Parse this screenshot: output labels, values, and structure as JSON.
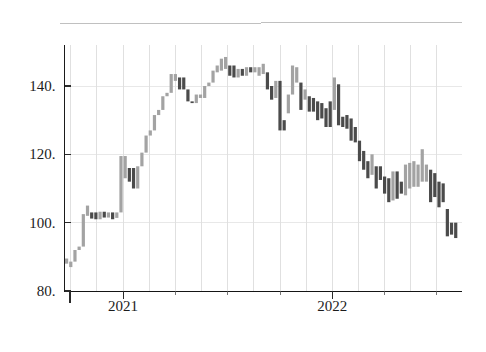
{
  "chart_data": {
    "type": "bar",
    "subtype": "candlestick-ohlc-weekly",
    "title": "",
    "subtitle": "",
    "xlabel": "",
    "ylabel": "",
    "ylim": [
      80,
      152
    ],
    "xlim": [
      2020.72,
      2022.62
    ],
    "grid": {
      "vertical": true,
      "horizontal": true,
      "style": "light-gray-quarterly"
    },
    "legend": {
      "visible": false,
      "entries": []
    },
    "y_ticks": [
      80,
      100,
      120,
      140
    ],
    "y_tick_labels": [
      "80.",
      "100.",
      "120.",
      "140."
    ],
    "x_ticks": [
      2021,
      2022
    ],
    "x_tick_labels": [
      "2021",
      "2022"
    ],
    "x_minor_ticks": [
      2020.75,
      2021.25,
      2021.5,
      2021.75,
      2022.25,
      2022.5
    ],
    "colors": {
      "up": "#a3a3a3",
      "down": "#4b4b4b",
      "axis": "#1a1a1a",
      "grid": "#d8d8d8",
      "background": "#ffffff",
      "text": "#1c1c1c"
    },
    "series_name": "price",
    "bar_width_px": 3.2,
    "note": "Each bar is one week: body spans open-close, direction light=rising, dark=falling",
    "bars": [
      {
        "x": 2020.73,
        "open": 88.0,
        "close": 89.5,
        "dir": "up"
      },
      {
        "x": 2020.75,
        "open": 87.0,
        "close": 88.6,
        "dir": "up"
      },
      {
        "x": 2020.77,
        "open": 88.6,
        "close": 92.0,
        "dir": "up"
      },
      {
        "x": 2020.79,
        "open": 92.0,
        "close": 93.0,
        "dir": "up"
      },
      {
        "x": 2020.81,
        "open": 93.0,
        "close": 102.5,
        "dir": "up"
      },
      {
        "x": 2020.83,
        "open": 102.0,
        "close": 105.0,
        "dir": "up"
      },
      {
        "x": 2020.85,
        "open": 101.2,
        "close": 103.0,
        "dir": "down"
      },
      {
        "x": 2020.87,
        "open": 103.0,
        "close": 101.0,
        "dir": "down"
      },
      {
        "x": 2020.89,
        "open": 101.0,
        "close": 103.2,
        "dir": "up"
      },
      {
        "x": 2020.91,
        "open": 103.2,
        "close": 101.5,
        "dir": "down"
      },
      {
        "x": 2020.93,
        "open": 101.5,
        "close": 103.0,
        "dir": "up"
      },
      {
        "x": 2020.95,
        "open": 103.0,
        "close": 101.0,
        "dir": "down"
      },
      {
        "x": 2020.97,
        "open": 101.4,
        "close": 103.0,
        "dir": "up"
      },
      {
        "x": 2020.99,
        "open": 103.0,
        "close": 119.5,
        "dir": "up"
      },
      {
        "x": 2021.01,
        "open": 113.0,
        "close": 119.5,
        "dir": "up"
      },
      {
        "x": 2021.03,
        "open": 112.0,
        "close": 116.0,
        "dir": "down"
      },
      {
        "x": 2021.05,
        "open": 116.0,
        "close": 110.0,
        "dir": "down"
      },
      {
        "x": 2021.07,
        "open": 110.0,
        "close": 116.5,
        "dir": "up"
      },
      {
        "x": 2021.09,
        "open": 116.5,
        "close": 120.5,
        "dir": "up"
      },
      {
        "x": 2021.11,
        "open": 120.5,
        "close": 125.5,
        "dir": "up"
      },
      {
        "x": 2021.13,
        "open": 125.5,
        "close": 127.0,
        "dir": "up"
      },
      {
        "x": 2021.15,
        "open": 127.0,
        "close": 131.5,
        "dir": "up"
      },
      {
        "x": 2021.17,
        "open": 131.5,
        "close": 133.0,
        "dir": "up"
      },
      {
        "x": 2021.19,
        "open": 133.0,
        "close": 137.0,
        "dir": "up"
      },
      {
        "x": 2021.21,
        "open": 137.0,
        "close": 138.0,
        "dir": "up"
      },
      {
        "x": 2021.23,
        "open": 138.0,
        "close": 143.5,
        "dir": "up"
      },
      {
        "x": 2021.25,
        "open": 141.5,
        "close": 143.5,
        "dir": "up"
      },
      {
        "x": 2021.27,
        "open": 139.0,
        "close": 142.5,
        "dir": "down"
      },
      {
        "x": 2021.29,
        "open": 142.5,
        "close": 139.0,
        "dir": "down"
      },
      {
        "x": 2021.31,
        "open": 139.0,
        "close": 135.5,
        "dir": "down"
      },
      {
        "x": 2021.33,
        "open": 135.5,
        "close": 135.0,
        "dir": "down"
      },
      {
        "x": 2021.35,
        "open": 135.0,
        "close": 137.5,
        "dir": "up"
      },
      {
        "x": 2021.37,
        "open": 137.5,
        "close": 136.5,
        "dir": "up"
      },
      {
        "x": 2021.39,
        "open": 136.5,
        "close": 140.0,
        "dir": "up"
      },
      {
        "x": 2021.41,
        "open": 140.0,
        "close": 141.0,
        "dir": "up"
      },
      {
        "x": 2021.43,
        "open": 141.0,
        "close": 144.5,
        "dir": "up"
      },
      {
        "x": 2021.45,
        "open": 144.0,
        "close": 146.0,
        "dir": "up"
      },
      {
        "x": 2021.47,
        "open": 144.5,
        "close": 148.0,
        "dir": "up"
      },
      {
        "x": 2021.49,
        "open": 145.0,
        "close": 148.5,
        "dir": "up"
      },
      {
        "x": 2021.51,
        "open": 143.0,
        "close": 146.0,
        "dir": "down"
      },
      {
        "x": 2021.53,
        "open": 146.0,
        "close": 142.5,
        "dir": "down"
      },
      {
        "x": 2021.55,
        "open": 142.5,
        "close": 145.0,
        "dir": "up"
      },
      {
        "x": 2021.57,
        "open": 145.0,
        "close": 143.0,
        "dir": "down"
      },
      {
        "x": 2021.59,
        "open": 143.0,
        "close": 145.5,
        "dir": "up"
      },
      {
        "x": 2021.61,
        "open": 145.5,
        "close": 144.0,
        "dir": "down"
      },
      {
        "x": 2021.63,
        "open": 144.0,
        "close": 145.5,
        "dir": "up"
      },
      {
        "x": 2021.65,
        "open": 143.0,
        "close": 145.5,
        "dir": "up"
      },
      {
        "x": 2021.67,
        "open": 143.5,
        "close": 146.5,
        "dir": "up"
      },
      {
        "x": 2021.69,
        "open": 144.0,
        "close": 139.0,
        "dir": "down"
      },
      {
        "x": 2021.71,
        "open": 140.0,
        "close": 136.0,
        "dir": "down"
      },
      {
        "x": 2021.73,
        "open": 136.5,
        "close": 141.5,
        "dir": "up"
      },
      {
        "x": 2021.75,
        "open": 141.5,
        "close": 127.0,
        "dir": "down"
      },
      {
        "x": 2021.77,
        "open": 130.0,
        "close": 127.0,
        "dir": "down"
      },
      {
        "x": 2021.79,
        "open": 132.0,
        "close": 137.5,
        "dir": "up"
      },
      {
        "x": 2021.81,
        "open": 137.5,
        "close": 146.0,
        "dir": "up"
      },
      {
        "x": 2021.83,
        "open": 141.0,
        "close": 145.5,
        "dir": "up"
      },
      {
        "x": 2021.85,
        "open": 133.0,
        "close": 141.0,
        "dir": "down"
      },
      {
        "x": 2021.87,
        "open": 136.0,
        "close": 139.0,
        "dir": "up"
      },
      {
        "x": 2021.89,
        "open": 132.5,
        "close": 137.0,
        "dir": "down"
      },
      {
        "x": 2021.91,
        "open": 132.5,
        "close": 136.5,
        "dir": "down"
      },
      {
        "x": 2021.93,
        "open": 130.0,
        "close": 135.5,
        "dir": "down"
      },
      {
        "x": 2021.95,
        "open": 130.5,
        "close": 135.0,
        "dir": "down"
      },
      {
        "x": 2021.97,
        "open": 128.0,
        "close": 133.5,
        "dir": "down"
      },
      {
        "x": 2021.99,
        "open": 128.0,
        "close": 135.5,
        "dir": "down"
      },
      {
        "x": 2022.01,
        "open": 133.0,
        "close": 142.5,
        "dir": "up"
      },
      {
        "x": 2022.03,
        "open": 128.5,
        "close": 140.5,
        "dir": "down"
      },
      {
        "x": 2022.05,
        "open": 128.0,
        "close": 131.0,
        "dir": "down"
      },
      {
        "x": 2022.07,
        "open": 127.5,
        "close": 131.5,
        "dir": "down"
      },
      {
        "x": 2022.09,
        "open": 124.0,
        "close": 130.5,
        "dir": "down"
      },
      {
        "x": 2022.11,
        "open": 123.5,
        "close": 128.0,
        "dir": "down"
      },
      {
        "x": 2022.13,
        "open": 118.0,
        "close": 124.0,
        "dir": "down"
      },
      {
        "x": 2022.15,
        "open": 115.5,
        "close": 121.0,
        "dir": "down"
      },
      {
        "x": 2022.17,
        "open": 113.0,
        "close": 118.0,
        "dir": "down"
      },
      {
        "x": 2022.19,
        "open": 114.0,
        "close": 120.0,
        "dir": "up"
      },
      {
        "x": 2022.21,
        "open": 110.0,
        "close": 116.5,
        "dir": "down"
      },
      {
        "x": 2022.23,
        "open": 112.5,
        "close": 116.5,
        "dir": "down"
      },
      {
        "x": 2022.25,
        "open": 108.5,
        "close": 113.5,
        "dir": "down"
      },
      {
        "x": 2022.27,
        "open": 106.0,
        "close": 113.0,
        "dir": "down"
      },
      {
        "x": 2022.29,
        "open": 106.5,
        "close": 115.0,
        "dir": "up"
      },
      {
        "x": 2022.31,
        "open": 107.0,
        "close": 115.0,
        "dir": "down"
      },
      {
        "x": 2022.33,
        "open": 108.5,
        "close": 112.0,
        "dir": "down"
      },
      {
        "x": 2022.35,
        "open": 108.0,
        "close": 117.0,
        "dir": "up"
      },
      {
        "x": 2022.37,
        "open": 110.0,
        "close": 117.5,
        "dir": "up"
      },
      {
        "x": 2022.39,
        "open": 110.5,
        "close": 118.0,
        "dir": "up"
      },
      {
        "x": 2022.41,
        "open": 110.5,
        "close": 117.0,
        "dir": "up"
      },
      {
        "x": 2022.43,
        "open": 112.0,
        "close": 121.5,
        "dir": "up"
      },
      {
        "x": 2022.45,
        "open": 112.0,
        "close": 117.0,
        "dir": "up"
      },
      {
        "x": 2022.47,
        "open": 106.0,
        "close": 115.5,
        "dir": "down"
      },
      {
        "x": 2022.49,
        "open": 107.5,
        "close": 114.5,
        "dir": "down"
      },
      {
        "x": 2022.51,
        "open": 104.5,
        "close": 112.0,
        "dir": "down"
      },
      {
        "x": 2022.53,
        "open": 106.0,
        "close": 111.5,
        "dir": "down"
      },
      {
        "x": 2022.55,
        "open": 96.0,
        "close": 104.0,
        "dir": "down"
      },
      {
        "x": 2022.57,
        "open": 96.5,
        "close": 100.0,
        "dir": "down"
      },
      {
        "x": 2022.59,
        "open": 95.5,
        "close": 100.0,
        "dir": "down"
      }
    ]
  }
}
